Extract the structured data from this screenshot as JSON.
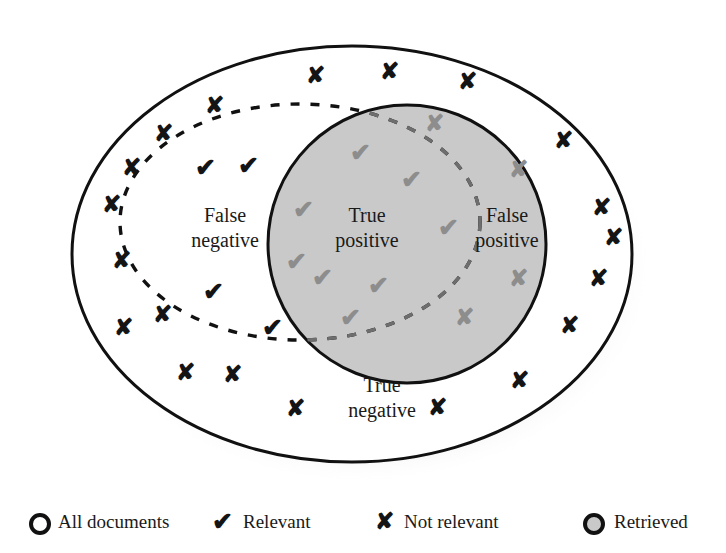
{
  "diagram": {
    "type": "venn-confusion-matrix",
    "title_text": "",
    "regions": [
      {
        "id": "false-negative",
        "line1": "False",
        "line2": "negative",
        "x": 225,
        "y": 222
      },
      {
        "id": "true-positive",
        "line1": "True",
        "line2": "positive",
        "x": 367,
        "y": 222
      },
      {
        "id": "false-positive",
        "line1": "False",
        "line2": "positive",
        "x": 507,
        "y": 222
      },
      {
        "id": "true-negative",
        "line1": "True",
        "line2": "negative",
        "x": 382,
        "y": 392
      }
    ],
    "shapes": {
      "all_documents": {
        "cx": 352,
        "cy": 254,
        "rx": 280,
        "ry": 208,
        "fill": "#ffffff",
        "stroke": "#111111",
        "stroke_width": 3
      },
      "relevant": {
        "cx": 300,
        "cy": 222,
        "rx": 180,
        "ry": 118,
        "fill": "none",
        "stroke": "#111111",
        "stroke_width": 3.4,
        "dash": "9 11"
      },
      "retrieved": {
        "cx": 407,
        "cy": 244,
        "rx": 139,
        "ry": 139,
        "fill": "#c9c9c9",
        "stroke": "#111111",
        "stroke_width": 3
      }
    },
    "colors": {
      "background": "#ffffff",
      "retrieved_fill": "#c9c9c9",
      "outline": "#111111",
      "mark_dark": "#141414",
      "mark_light": "#8d8d8d",
      "shadow": "#b9b9b9"
    },
    "marks": {
      "glyph_relevant": "✔",
      "glyph_not_relevant": "✘",
      "true_negative_x": [
        {
          "x": 315,
          "y": 78
        },
        {
          "x": 389,
          "y": 74
        },
        {
          "x": 467,
          "y": 84
        },
        {
          "x": 214,
          "y": 108
        },
        {
          "x": 563,
          "y": 143
        },
        {
          "x": 163,
          "y": 136
        },
        {
          "x": 131,
          "y": 170
        },
        {
          "x": 111,
          "y": 207
        },
        {
          "x": 601,
          "y": 210
        },
        {
          "x": 121,
          "y": 263
        },
        {
          "x": 613,
          "y": 240
        },
        {
          "x": 598,
          "y": 281
        },
        {
          "x": 123,
          "y": 330
        },
        {
          "x": 185,
          "y": 375
        },
        {
          "x": 232,
          "y": 377
        },
        {
          "x": 295,
          "y": 411
        },
        {
          "x": 437,
          "y": 410
        },
        {
          "x": 519,
          "y": 383
        },
        {
          "x": 569,
          "y": 328
        }
      ],
      "false_negative_v": [
        {
          "x": 205,
          "y": 170
        },
        {
          "x": 248,
          "y": 168
        },
        {
          "x": 213,
          "y": 294
        },
        {
          "x": 272,
          "y": 330
        }
      ],
      "false_negative_x_inside": [
        {
          "x": 162,
          "y": 317
        }
      ],
      "true_positive_v": [
        {
          "x": 360,
          "y": 155
        },
        {
          "x": 303,
          "y": 212
        },
        {
          "x": 411,
          "y": 182
        },
        {
          "x": 296,
          "y": 264
        },
        {
          "x": 322,
          "y": 280
        },
        {
          "x": 378,
          "y": 288
        },
        {
          "x": 350,
          "y": 320
        },
        {
          "x": 448,
          "y": 230
        }
      ],
      "false_positive_x_inside": [
        {
          "x": 434,
          "y": 126
        },
        {
          "x": 518,
          "y": 172
        },
        {
          "x": 518,
          "y": 281
        },
        {
          "x": 464,
          "y": 320
        }
      ]
    }
  },
  "legend": {
    "items": [
      {
        "id": "all-documents",
        "icon": "circle-outline-icon",
        "label": "All documents",
        "icon_x": 40,
        "text_x": 58,
        "fill": "none"
      },
      {
        "id": "relevant",
        "icon": "check-icon",
        "label": "Relevant",
        "icon_x": 222,
        "text_x": 243,
        "fill": "none"
      },
      {
        "id": "not-relevant",
        "icon": "cross-icon",
        "label": "Not relevant",
        "icon_x": 384,
        "text_x": 404,
        "fill": "none"
      },
      {
        "id": "retrieved",
        "icon": "circle-filled-icon",
        "label": "Retrieved",
        "icon_x": 594,
        "text_x": 614,
        "fill": "#c9c9c9"
      }
    ],
    "baseline_y": 524
  }
}
